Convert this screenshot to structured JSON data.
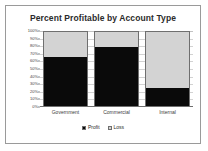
{
  "chart_data": {
    "type": "bar",
    "subtype": "stacked-100-percent",
    "title": "Percent Profitable by Account Type",
    "xlabel": "",
    "ylabel": "",
    "categories": [
      "Government",
      "Commercial",
      "Internal"
    ],
    "series": [
      {
        "name": "Profit",
        "color": "#0a0a0a",
        "values": [
          64,
          77,
          24
        ]
      },
      {
        "name": "Loss",
        "color": "#d3d3d3",
        "values": [
          36,
          23,
          76
        ]
      }
    ],
    "ylim": [
      0,
      100
    ],
    "ytick_labels": [
      "100%",
      "90%",
      "80%",
      "70%",
      "60%",
      "50%",
      "40%",
      "30%",
      "20%",
      "10%",
      "0%"
    ],
    "ytick_values": [
      100,
      90,
      80,
      70,
      60,
      50,
      40,
      30,
      20,
      10,
      0
    ],
    "grid": true,
    "legend_position": "bottom",
    "legend_entries": [
      "Profit",
      "Loss"
    ]
  },
  "colors": {
    "profit": "#0a0a0a",
    "loss": "#d3d3d3",
    "frame_border": "#9a9a9a",
    "gridline": "#d2d2d2",
    "axis": "#6e6e6e",
    "background": "#ffffff"
  }
}
